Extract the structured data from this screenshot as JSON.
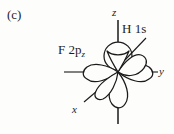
{
  "figure": {
    "panel_label": "(c)",
    "background_color": "#fdfdfc",
    "ink_color": "#1a1a1a"
  },
  "annotations": {
    "orbital_left": {
      "text_main": "F 2p",
      "text_sub": "z",
      "full": "F 2pz"
    },
    "orbital_right": {
      "full": "H 1s"
    }
  },
  "axes": {
    "z": {
      "label": "z",
      "orientation": "vertical"
    },
    "y": {
      "label": "y",
      "orientation": "horizontal-right"
    },
    "x": {
      "label": "x",
      "orientation": "diagonal-lower-left"
    }
  }
}
